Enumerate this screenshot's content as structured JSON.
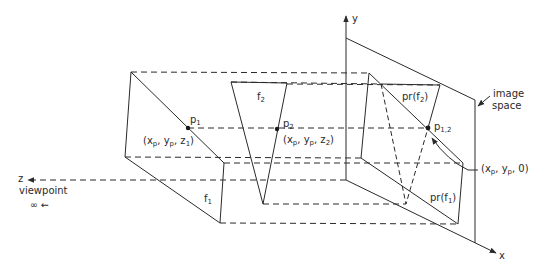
{
  "diagram": {
    "type": "3D projection of faces onto image space (hidden surface illustration)",
    "axes": {
      "x": "x",
      "y": "y",
      "z": "z"
    },
    "viewpoint": {
      "label": "viewpoint",
      "sub": "∞ ←"
    },
    "image_space": {
      "line1": "image",
      "line2": "space"
    },
    "faces": {
      "f1": {
        "name": "f",
        "sub": "1"
      },
      "f2": {
        "name": "f",
        "sub": "2"
      },
      "pr_f1": {
        "pre": "pr(f",
        "sub": "1",
        "post": ")"
      },
      "pr_f2": {
        "pre": "pr(f",
        "sub": "2",
        "post": ")"
      }
    },
    "points": {
      "p1": {
        "name": "p",
        "sub": "1",
        "coord_pre": "(x",
        "coord_sub1": "p",
        "coord_mid": ", y",
        "coord_sub2": "p",
        "coord_z": ", z",
        "coord_zsub": "1",
        "coord_end": ")"
      },
      "p2": {
        "name": "p",
        "sub": "2",
        "coord_pre": "(x",
        "coord_sub1": "p",
        "coord_mid": ", y",
        "coord_sub2": "p",
        "coord_z": ", z",
        "coord_zsub": "2",
        "coord_end": ")"
      },
      "p12": {
        "name": "p",
        "sub": "1,2",
        "coord_pre": "(x",
        "coord_sub1": "p",
        "coord_mid": ", y",
        "coord_sub2": "p",
        "coord_end": ", 0)"
      }
    },
    "colors": {
      "line": "#2a2a2a",
      "background": "#ffffff"
    }
  }
}
